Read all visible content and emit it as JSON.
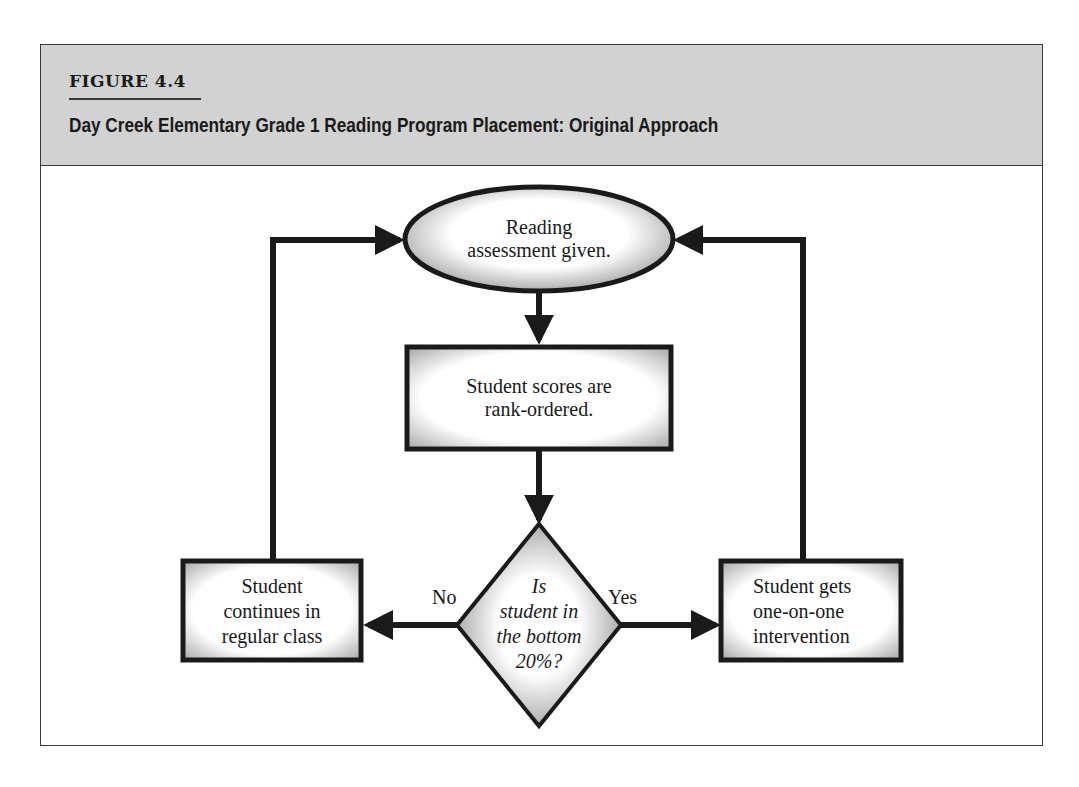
{
  "figure": {
    "label": "FIGURE 4.4",
    "title": "Day Creek Elementary Grade 1 Reading Program Placement: Original Approach"
  },
  "nodes": {
    "start": {
      "shape": "ellipse",
      "lines": [
        "Reading",
        "assessment given."
      ]
    },
    "rank": {
      "shape": "rectangle",
      "lines": [
        "Student scores are",
        "rank-ordered."
      ]
    },
    "decision": {
      "shape": "diamond",
      "lines": [
        "Is",
        "student in",
        "the bottom",
        "20%?"
      ]
    },
    "regular": {
      "shape": "rectangle",
      "lines": [
        "Student",
        "continues in",
        "regular class"
      ]
    },
    "intervention": {
      "shape": "rectangle",
      "lines": [
        "Student gets",
        "one-on-one",
        "intervention"
      ]
    }
  },
  "edges": {
    "no_label": "No",
    "yes_label": "Yes"
  },
  "colors": {
    "header_bg": "#d2d2d2",
    "stroke": "#1a1a1a",
    "frame": "#3a3a3a"
  }
}
